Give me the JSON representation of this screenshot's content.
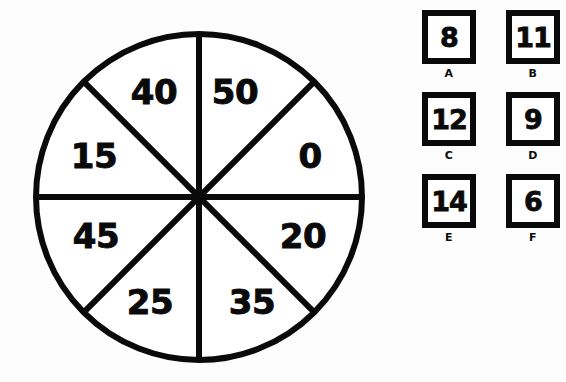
{
  "spinner": {
    "name": "eight-sector-spinner",
    "center_x": 199,
    "center_y": 197,
    "radius": 163,
    "stroke_color": "#0a0a0a",
    "fill_color": "#ffffff",
    "sectors": [
      {
        "label": "50",
        "angle_deg": 22.5,
        "label_x": 235,
        "label_y": 92
      },
      {
        "label": "0",
        "angle_deg": 67.5,
        "label_x": 310,
        "label_y": 156
      },
      {
        "label": "20",
        "angle_deg": 112.5,
        "label_x": 303,
        "label_y": 236
      },
      {
        "label": "35",
        "angle_deg": 157.5,
        "label_x": 252,
        "label_y": 302
      },
      {
        "label": "25",
        "angle_deg": 202.5,
        "label_x": 150,
        "label_y": 302
      },
      {
        "label": "45",
        "angle_deg": 247.5,
        "label_x": 96,
        "label_y": 236
      },
      {
        "label": "15",
        "angle_deg": 292.5,
        "label_x": 94,
        "label_y": 156
      },
      {
        "label": "40",
        "angle_deg": 337.5,
        "label_x": 154,
        "label_y": 92
      }
    ]
  },
  "options": {
    "name": "answer-choice-grid",
    "columns": 2,
    "rows": 3,
    "items": [
      {
        "letter": "A",
        "value": "8"
      },
      {
        "letter": "B",
        "value": "11"
      },
      {
        "letter": "C",
        "value": "12"
      },
      {
        "letter": "D",
        "value": "9"
      },
      {
        "letter": "E",
        "value": "14"
      },
      {
        "letter": "F",
        "value": "6"
      }
    ]
  }
}
